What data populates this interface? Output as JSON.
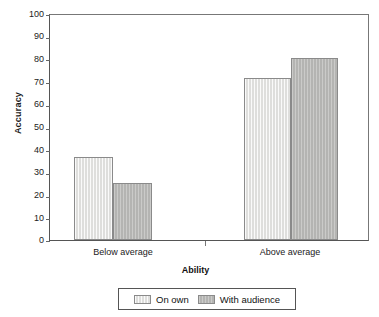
{
  "chart_data": {
    "type": "bar",
    "title": "",
    "xlabel": "Ability",
    "ylabel": "Accuracy",
    "categories": [
      "Below average",
      "Above average"
    ],
    "series": [
      {
        "name": "On own",
        "values": [
          36.7,
          71.7
        ],
        "color": "#dededc"
      },
      {
        "name": "With audience",
        "values": [
          25.2,
          80.5
        ],
        "color": "#b4b4b2"
      }
    ],
    "ylim": [
      0,
      100
    ],
    "ytick_step": 10,
    "yticks": [
      100,
      90,
      80,
      70,
      60,
      50,
      40,
      30,
      20,
      10,
      0
    ],
    "ytick_labels": [
      "100",
      "90",
      "80",
      "70",
      "60",
      "50",
      "40",
      "30",
      "20",
      "10",
      "0"
    ],
    "grid": false,
    "legend_position": "bottom-center"
  },
  "axes": {
    "y_title": "Accuracy",
    "x_title": "Ability",
    "y_labels": {
      "t100": "100",
      "t90": "90",
      "t80": "80",
      "t70": "70",
      "t60": "60",
      "t50": "50",
      "t40": "40",
      "t30": "30",
      "t20": "20",
      "t10": "10",
      "t0": "0"
    },
    "x_labels": {
      "cat0": "Below average",
      "cat1": "Above average"
    }
  },
  "legend": {
    "entries": [
      {
        "label": "On own",
        "swatch": "light-gray-striped-swatch"
      },
      {
        "label": "With audience",
        "swatch": "medium-gray-striped-swatch"
      }
    ]
  },
  "colors": {
    "series_on_own": "#dededc",
    "series_with_audience": "#b4b4b2",
    "bar_border": "#8a8a8a",
    "axis": "#555555",
    "text": "#1a1a1a",
    "background": "#ffffff"
  }
}
